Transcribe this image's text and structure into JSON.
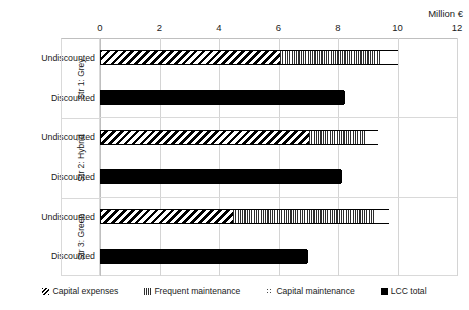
{
  "chart_data": {
    "type": "bar",
    "orientation": "horizontal",
    "stacked": true,
    "title": "",
    "xlabel": "Million €",
    "ylabel": "",
    "xlim": [
      0,
      12
    ],
    "xticks": [
      0,
      2,
      4,
      6,
      8,
      10,
      12
    ],
    "grid": true,
    "legend_position": "bottom",
    "axis_position": "top",
    "legend": [
      {
        "name": "Capital expenses",
        "pattern": "diagonal-hatch"
      },
      {
        "name": "Frequent maintenance",
        "pattern": "vertical-lines"
      },
      {
        "name": "Capital maintenance",
        "pattern": "dotted"
      },
      {
        "name": "LCC total",
        "pattern": "solid-black"
      }
    ],
    "groups": [
      {
        "label": "Str 1: Grey",
        "rows": [
          {
            "label": "Undiscounted",
            "segments": [
              {
                "series": "Capital expenses",
                "value": 6.0
              },
              {
                "series": "Frequent maintenance",
                "value": 3.4
              },
              {
                "series": "Capital maintenance",
                "value": 0.6
              }
            ],
            "total": 10.0
          },
          {
            "label": "Discounted",
            "segments": [
              {
                "series": "LCC total",
                "value": 8.2
              }
            ],
            "total": 8.2
          }
        ]
      },
      {
        "label": "Str 2: Hybrid",
        "rows": [
          {
            "label": "Undiscounted",
            "segments": [
              {
                "series": "Capital expenses",
                "value": 7.0
              },
              {
                "series": "Frequent maintenance",
                "value": 1.9
              },
              {
                "series": "Capital maintenance",
                "value": 0.45
              }
            ],
            "total": 9.35
          },
          {
            "label": "Discounted",
            "segments": [
              {
                "series": "LCC total",
                "value": 8.1
              }
            ],
            "total": 8.1
          }
        ]
      },
      {
        "label": "Str 3: Green",
        "rows": [
          {
            "label": "Undiscounted",
            "segments": [
              {
                "series": "Capital expenses",
                "value": 4.45
              },
              {
                "series": "Frequent maintenance",
                "value": 4.75
              },
              {
                "series": "Capital maintenance",
                "value": 0.5
              }
            ],
            "total": 9.7
          },
          {
            "label": "Discounted",
            "segments": [
              {
                "series": "LCC total",
                "value": 6.95
              }
            ],
            "total": 6.95
          }
        ]
      }
    ]
  },
  "axis": {
    "unit_label": "Million €",
    "tick_labels": [
      "0",
      "2",
      "4",
      "6",
      "8",
      "10",
      "12"
    ]
  },
  "groups_labels": [
    "Str 1: Grey",
    "Str 2: Hybrid",
    "Str 3: Green"
  ],
  "row_labels": [
    "Undiscounted",
    "Discounted"
  ],
  "legend_labels": [
    "Capital expenses",
    "Frequent maintenance",
    "Capital maintenance",
    "LCC total"
  ],
  "colors": {
    "ink": "#000000",
    "grid": "#d4d4d4",
    "axis": "#bfbfbf",
    "freq_fill": "#2e2e2e",
    "dot_fill": "#4a4a4a"
  }
}
